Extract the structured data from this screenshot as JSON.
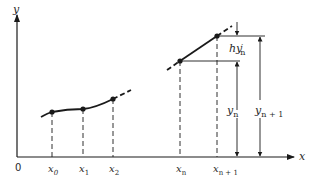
{
  "diagram": {
    "type": "euler-method-illustration",
    "axes": {
      "x_label": "x",
      "y_label": "y",
      "origin_label": "0"
    },
    "points": [
      {
        "label": "x0",
        "base": "x",
        "sub": "0"
      },
      {
        "label": "x1",
        "base": "x",
        "sub": "1"
      },
      {
        "label": "x2",
        "base": "x",
        "sub": "2"
      },
      {
        "label": "xn",
        "base": "x",
        "sub": "n"
      },
      {
        "label": "xn+1",
        "base": "x",
        "sub": "n + 1"
      }
    ],
    "annotations": {
      "increment": {
        "base": "hy",
        "prime": "′",
        "sub": "n"
      },
      "yn": {
        "base": "y",
        "sub": "n"
      },
      "yn1": {
        "base": "y",
        "sub": "n + 1"
      }
    },
    "colors": {
      "ink": "#1a1a1a",
      "background": "#ffffff"
    }
  }
}
